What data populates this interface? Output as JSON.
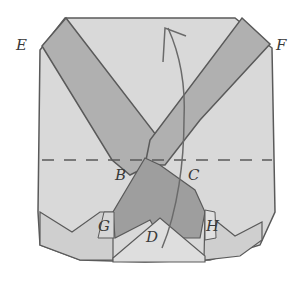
{
  "diagram": {
    "type": "origami-fold-illustration",
    "labels": {
      "E": "E",
      "F": "F",
      "B": "B",
      "C": "C",
      "G": "G",
      "H": "H",
      "D": "D"
    },
    "colors": {
      "paper_light": "#d9d9d9",
      "paper_mid": "#c4c4c4",
      "band_dark": "#a9a9a9",
      "center_dark": "#9a9a9a",
      "outline": "#5a5a5a",
      "background": "#ffffff"
    },
    "fold_line": {
      "style": "dashed",
      "label": "valley fold between B and C"
    },
    "arrow": {
      "type": "curved fold arrow",
      "direction": "up"
    }
  }
}
